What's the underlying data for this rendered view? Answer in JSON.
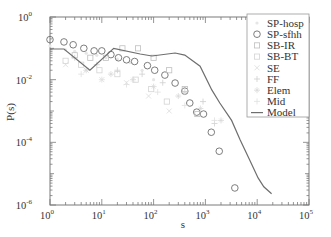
{
  "chart_data": {
    "type": "scatter",
    "title": "",
    "xlabel": "s",
    "ylabel": "P(s)",
    "xscale": "log",
    "yscale": "log",
    "xlim": [
      1,
      100000
    ],
    "ylim": [
      1e-06,
      1
    ],
    "x_ticks": [
      "10^0",
      "10^1",
      "10^2",
      "10^3",
      "10^4",
      "10^5"
    ],
    "y_ticks": [
      "10^0",
      "10^-2",
      "10^-4",
      "10^-6"
    ],
    "grid": false,
    "legend_position": "upper right",
    "legend": [
      "SP-hosp",
      "SP-sfhh",
      "SB-IR",
      "SB-BT",
      "SE",
      "FF",
      "Elem",
      "Mid",
      "Model"
    ],
    "series": [
      {
        "name": "SP-hosp",
        "marker": "faint",
        "color": "#e6e6e6",
        "x": [
          1,
          2,
          3,
          5,
          8,
          12,
          20,
          35,
          60,
          100
        ],
        "y": [
          0.12,
          0.09,
          0.08,
          0.07,
          0.06,
          0.05,
          0.045,
          0.035,
          0.02,
          0.01
        ]
      },
      {
        "name": "SP-sfhh",
        "marker": "circle",
        "color": "#6e6e6e",
        "x": [
          1,
          1.86,
          2.8,
          4.5,
          7.1,
          10,
          15,
          21,
          30,
          43,
          76,
          105,
          165,
          260,
          400,
          500,
          680,
          920,
          1300,
          1850,
          3700
        ],
        "y": [
          0.19,
          0.16,
          0.13,
          0.1,
          0.083,
          0.083,
          0.063,
          0.05,
          0.043,
          0.038,
          0.028,
          0.02,
          0.014,
          0.0078,
          0.0043,
          0.0018,
          0.00092,
          0.0008,
          0.00021,
          5.2e-05,
          3.5e-06
        ]
      },
      {
        "name": "SB-IR",
        "marker": "square",
        "color": "#bfbfbf",
        "x": [
          3,
          6,
          12,
          25,
          50,
          100,
          200,
          400,
          700
        ],
        "y": [
          0.06,
          0.05,
          0.05,
          0.1,
          0.1,
          0.05,
          0.02,
          0.005,
          0.0008
        ]
      },
      {
        "name": "SB-BT",
        "marker": "square",
        "color": "#d4d4d4",
        "x": [
          2,
          4,
          9,
          20,
          45,
          90,
          180
        ],
        "y": [
          0.04,
          0.03,
          0.02,
          0.015,
          0.01,
          0.005,
          0.002
        ]
      },
      {
        "name": "SE",
        "marker": "cross",
        "color": "#dcdcdc",
        "x": [
          2,
          5,
          10,
          30,
          80,
          200
        ],
        "y": [
          0.03,
          0.02,
          0.01,
          0.008,
          0.003,
          0.001
        ]
      },
      {
        "name": "FF",
        "marker": "plus",
        "color": "#cfcfcf",
        "x": [
          3,
          8,
          20,
          60,
          150,
          400,
          900,
          1500
        ],
        "y": [
          0.05,
          0.03,
          0.02,
          0.015,
          0.008,
          0.004,
          0.002,
          0.0004
        ]
      },
      {
        "name": "Elem",
        "marker": "star",
        "color": "#d8d8d8",
        "x": [
          5,
          15,
          40,
          100,
          300,
          800,
          2000
        ],
        "y": [
          0.02,
          0.015,
          0.01,
          0.006,
          0.003,
          0.0012,
          0.0005
        ]
      },
      {
        "name": "Mid",
        "marker": "plus",
        "color": "#e0e0e0",
        "x": [
          4,
          10,
          30,
          120,
          400,
          1500
        ],
        "y": [
          0.015,
          0.01,
          0.007,
          0.004,
          0.0015,
          0.0005
        ]
      },
      {
        "name": "Model",
        "marker": "line",
        "color": "#6e6e6e",
        "x": [
          1,
          1.86,
          5.9,
          17,
          55,
          93,
          260,
          400,
          790,
          1330,
          1900,
          3200,
          4700,
          7200,
          10400,
          13400,
          19000
        ],
        "y": [
          0.095,
          0.095,
          0.02,
          0.1,
          0.066,
          0.057,
          0.071,
          0.061,
          0.027,
          0.0047,
          0.0018,
          0.0005,
          0.00012,
          2.7e-05,
          7.3e-06,
          3.8e-06,
          2.3e-06
        ]
      }
    ]
  },
  "axes": {
    "xlabel": "s",
    "ylabel": "P(s)",
    "x_tick_base": [
      "10",
      "10",
      "10",
      "10",
      "10",
      "10"
    ],
    "x_tick_exp": [
      "0",
      "1",
      "2",
      "3",
      "4",
      "5"
    ],
    "y_tick_base": [
      "10",
      "10",
      "10",
      "10"
    ],
    "y_tick_exp": [
      "0",
      "-2",
      "-4",
      "-6"
    ]
  },
  "legend": {
    "items": [
      "SP-hosp",
      "SP-sfhh",
      "SB-IR",
      "SB-BT",
      "SE",
      "FF",
      "Elem",
      "Mid",
      "Model"
    ]
  }
}
